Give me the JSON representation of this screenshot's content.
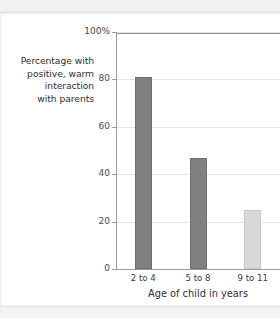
{
  "chart_data": {
    "type": "bar",
    "title": "",
    "categories": [
      "2 to 4",
      "5 to 8",
      "9 to 11"
    ],
    "values": [
      81,
      47,
      25
    ],
    "xlabel": "Age of child in years",
    "ylabel": "Percentage with positive, warm interaction with parents",
    "ylabel_lines": [
      "Percentage with",
      "positive, warm",
      "interaction",
      "with parents"
    ],
    "ylim": [
      0,
      100
    ],
    "yticks": [
      0,
      20,
      40,
      60,
      80,
      100
    ],
    "ytick_labels": [
      "0",
      "20",
      "40",
      "60",
      "80",
      "100%"
    ],
    "grid": true,
    "legend": "none",
    "bar_colors": [
      "#808080",
      "#808080",
      "#d8d8d8"
    ],
    "bar_edge_colors": [
      "#6e6e6e",
      "#6e6e6e",
      "#c8c8c8"
    ]
  },
  "colors": {
    "bar_dark": "#808080",
    "bar_light": "#d8d8d8",
    "axis": "#9a9a9a",
    "gridline": "#e4e4e4",
    "frame_top": "#8c8c8c",
    "text": "#2f2f2f",
    "page_band": "#f1f1f1"
  }
}
